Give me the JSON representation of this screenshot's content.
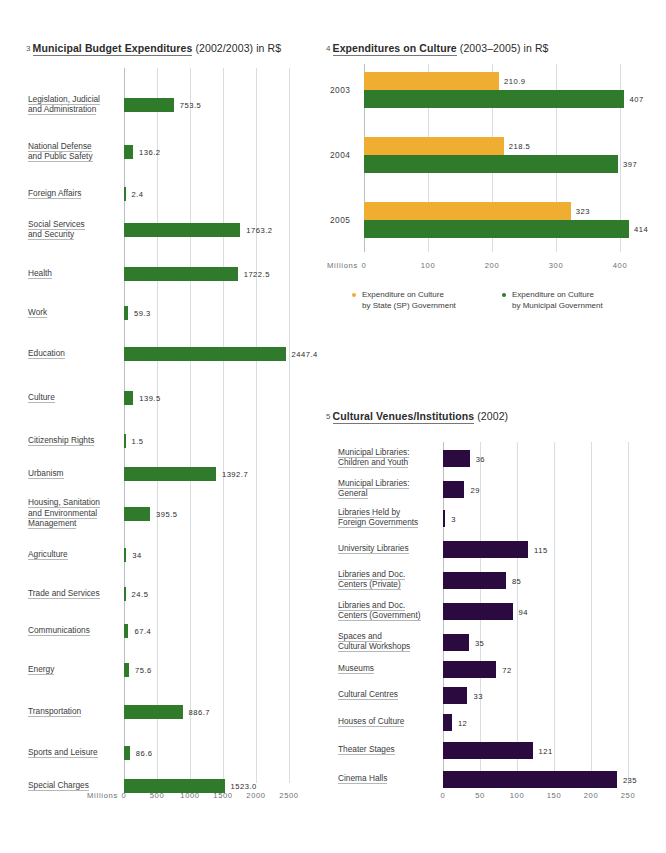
{
  "charts": [
    {
      "number": "3",
      "title_strong": "Municipal Budget Expenditures",
      "title_paren": "(2002/2003) in R$",
      "axis_unit": "Millions",
      "chart_data": {
        "type": "bar",
        "orientation": "horizontal",
        "title": "Municipal Budget Expenditures (2002/2003) in R$",
        "xlabel": "Millions",
        "ylabel": "",
        "xlim": [
          0,
          2500
        ],
        "ticks": [
          "0",
          "500",
          "1000",
          "1500",
          "2000",
          "2500"
        ],
        "tick_values": [
          0,
          500,
          1000,
          1500,
          2000,
          2500
        ],
        "grid": true,
        "color": "#2f7a2b",
        "categories": [
          "Legislation, Judicial\nand Administration",
          "National Defense\nand Public Safety",
          "Foreign Affairs",
          "Social Services\nand Security",
          "Health",
          "Work",
          "Education",
          "Culture",
          "Citizenship Rights",
          "Urbanism",
          "Housing, Sanitation\nand Environmental\nManagement",
          "Agriculture",
          "Trade and Services",
          "Communications",
          "Energy",
          "Transportation",
          "Sports and Leisure",
          "Special Charges"
        ],
        "values": [
          753.5,
          136.2,
          2.4,
          1763.2,
          1722.5,
          59.3,
          2447.4,
          139.5,
          1.5,
          1392.7,
          395.5,
          34,
          24.5,
          67.4,
          75.6,
          886.7,
          86.6,
          1523.0
        ],
        "value_labels": [
          "753.5",
          "136.2",
          "2.4",
          "1763.2",
          "1722.5",
          "59.3",
          "2447.4",
          "139.5",
          "1.5",
          "1392.7",
          "395.5",
          "34",
          "24.5",
          "67.4",
          "75.6",
          "886.7",
          "86.6",
          "1523.0"
        ]
      }
    },
    {
      "number": "4",
      "title_strong": "Expenditures on Culture",
      "title_paren": "(2003–2005) in R$",
      "axis_unit": "Millions",
      "legend": [
        {
          "color": "#efae32",
          "label": "Expenditure on Culture\nby State (SP) Government"
        },
        {
          "color": "#2f7a2b",
          "label": "Expenditure on Culture\nby Municipal Government"
        }
      ],
      "chart_data": {
        "type": "bar",
        "orientation": "horizontal",
        "title": "Expenditures on Culture (2003–2005) in R$",
        "xlabel": "Millions",
        "ylabel": "",
        "xlim": [
          0,
          400
        ],
        "ticks": [
          "0",
          "100",
          "200",
          "300",
          "400"
        ],
        "tick_values": [
          0,
          100,
          200,
          300,
          400
        ],
        "grid": true,
        "categories": [
          "2003",
          "2004",
          "2005"
        ],
        "series": [
          {
            "name": "Expenditure on Culture by State (SP) Government",
            "color": "#efae32",
            "values": [
              210.9,
              218.5,
              323
            ],
            "value_labels": [
              "210.9",
              "218.5",
              "323"
            ]
          },
          {
            "name": "Expenditure on Culture by Municipal Government",
            "color": "#2f7a2b",
            "values": [
              407,
              397,
              414
            ],
            "value_labels": [
              "407",
              "397",
              "414"
            ]
          }
        ]
      }
    },
    {
      "number": "5",
      "title_strong": "Cultural Venues/Institutions",
      "title_paren": "(2002)",
      "axis_unit": "",
      "chart_data": {
        "type": "bar",
        "orientation": "horizontal",
        "title": "Cultural Venues/Institutions (2002)",
        "xlabel": "",
        "ylabel": "",
        "xlim": [
          0,
          250
        ],
        "ticks": [
          "0",
          "50",
          "100",
          "150",
          "200",
          "250"
        ],
        "tick_values": [
          0,
          50,
          100,
          150,
          200,
          250
        ],
        "grid": true,
        "color": "#2b0b3f",
        "categories": [
          "Municipal Libraries:\nChildren and Youth",
          "Municipal Libraries:\nGeneral",
          "Libraries Held by\nForeign Governments",
          "University Libraries",
          "Libraries and Doc.\nCenters (Private)",
          "Libraries and Doc.\nCenters (Government)",
          "Spaces and\nCultural Workshops",
          "Museums",
          "Cultural Centres",
          "Houses of Culture",
          "Theater Stages",
          "Cinema Halls"
        ],
        "values": [
          36,
          29,
          3,
          115,
          85,
          94,
          35,
          72,
          33,
          12,
          121,
          235
        ],
        "value_labels": [
          "36",
          "29",
          "3",
          "115",
          "85",
          "94",
          "35",
          "72",
          "33",
          "12",
          "121",
          "235"
        ]
      }
    }
  ]
}
